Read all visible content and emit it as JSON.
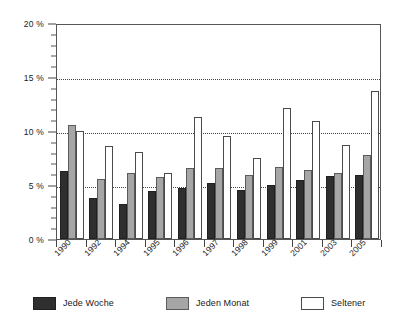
{
  "chart_data": {
    "type": "bar",
    "title": "",
    "subtitle": "",
    "xlabel": "",
    "ylabel": "",
    "ylim": [
      0,
      20
    ],
    "y_ticks": [
      "0 %",
      "5 %",
      "10 %",
      "15 %",
      "20 %"
    ],
    "y_tick_values": [
      0,
      5,
      10,
      15,
      20
    ],
    "y_minor_tick_step": 1,
    "grid": "horizontal dotted at 5 %, 10 %, 15 %",
    "legend_position": "below",
    "categories": [
      "1990",
      "1992",
      "1994",
      "1995",
      "1996",
      "1997",
      "1998",
      "1999",
      "2001",
      "2003",
      "2005"
    ],
    "series": [
      {
        "name": "Jede Woche",
        "color": "#2f2f2f",
        "values": [
          6.3,
          3.8,
          3.2,
          4.4,
          4.7,
          5.2,
          4.5,
          5.0,
          5.5,
          5.8,
          5.9
        ]
      },
      {
        "name": "Jeden Monat",
        "color": "#a6a6a6",
        "values": [
          10.6,
          5.6,
          6.1,
          5.7,
          6.6,
          6.6,
          5.9,
          6.7,
          6.4,
          6.1,
          7.8
        ]
      },
      {
        "name": "Seltener",
        "color": "#ffffff",
        "values": [
          10.0,
          8.6,
          8.1,
          6.1,
          11.3,
          9.5,
          7.5,
          12.1,
          10.9,
          8.7,
          13.7
        ]
      }
    ]
  },
  "legend": {
    "items": [
      {
        "label": "Jede Woche",
        "swatch": "dark-swatch"
      },
      {
        "label": "Jeden Monat",
        "swatch": "gray-swatch"
      },
      {
        "label": "Seltener",
        "swatch": "white-swatch"
      }
    ]
  }
}
